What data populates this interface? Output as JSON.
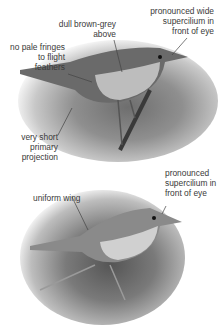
{
  "figure": {
    "top_photo": {
      "subject": "warbler perched on branch (upper image)",
      "annotations": [
        {
          "id": "supercilium_wide",
          "text_lines": [
            "pronounced wide",
            "supercilium in",
            "front of eye"
          ]
        },
        {
          "id": "upperparts",
          "text_lines": [
            "dull brown-grey",
            "above"
          ]
        },
        {
          "id": "fringes",
          "text_lines": [
            "no pale fringes",
            "to flight",
            "feathers"
          ]
        },
        {
          "id": "projection",
          "text_lines": [
            "very short",
            "primary",
            "projection"
          ]
        }
      ]
    },
    "bottom_photo": {
      "subject": "warbler among vegetation (lower image)",
      "annotations": [
        {
          "id": "supercilium",
          "text_lines": [
            "pronounced",
            "supercilium in",
            "front of eye"
          ]
        },
        {
          "id": "wing",
          "text_lines": [
            "uniform wing"
          ]
        }
      ]
    }
  }
}
